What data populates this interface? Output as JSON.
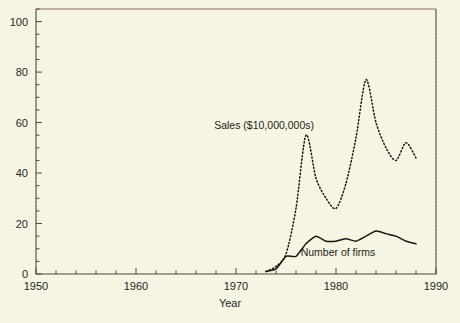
{
  "chart_data": {
    "type": "line",
    "title": "",
    "xlabel": "Year",
    "ylabel": "",
    "xlim": [
      1950,
      1990
    ],
    "ylim": [
      0,
      105
    ],
    "grid": false,
    "legend_position": "inline-annotations",
    "x_ticks": [
      1950,
      1960,
      1970,
      1980,
      1990
    ],
    "x_tick_labels": [
      "1950",
      "1960",
      "1970",
      "1980",
      "1990"
    ],
    "x_minor_step": 2,
    "y_ticks": [
      0,
      20,
      40,
      60,
      80,
      100
    ],
    "y_tick_labels": [
      "0",
      "20",
      "40",
      "60",
      "80",
      "100"
    ],
    "y_minor_step": 5,
    "series": [
      {
        "name": "Sales ($10,000,000s)",
        "style": "dotted",
        "annotation": "Sales ($10,000,000s)",
        "x": [
          1973,
          1974,
          1975,
          1976,
          1977,
          1978,
          1979,
          1980,
          1981,
          1982,
          1983,
          1984,
          1985,
          1986,
          1987,
          1988
        ],
        "values": [
          1,
          3,
          8,
          26,
          55,
          38,
          30,
          26,
          36,
          54,
          77,
          60,
          50,
          45,
          52,
          46
        ]
      },
      {
        "name": "Number of firms",
        "style": "solid",
        "annotation": "Number of firms",
        "x": [
          1973,
          1974,
          1975,
          1976,
          1977,
          1978,
          1979,
          1980,
          1981,
          1982,
          1983,
          1984,
          1985,
          1986,
          1987,
          1988
        ],
        "values": [
          1,
          2,
          7,
          7,
          12,
          15,
          13,
          13,
          14,
          13,
          15,
          17,
          16,
          15,
          13,
          12
        ]
      }
    ],
    "annotations": [
      {
        "text": "Sales ($10,000,000s)",
        "x": 1977.8,
        "y": 57.5,
        "anchor": "end"
      },
      {
        "text": "Number of firms",
        "x": 1980.2,
        "y": 7.0,
        "anchor": "middle"
      }
    ]
  },
  "colors": {
    "background": "#f7f5e3",
    "axis": "#4a4a3c",
    "ink": "#16160f",
    "top_rule": "#8d6b5c"
  }
}
